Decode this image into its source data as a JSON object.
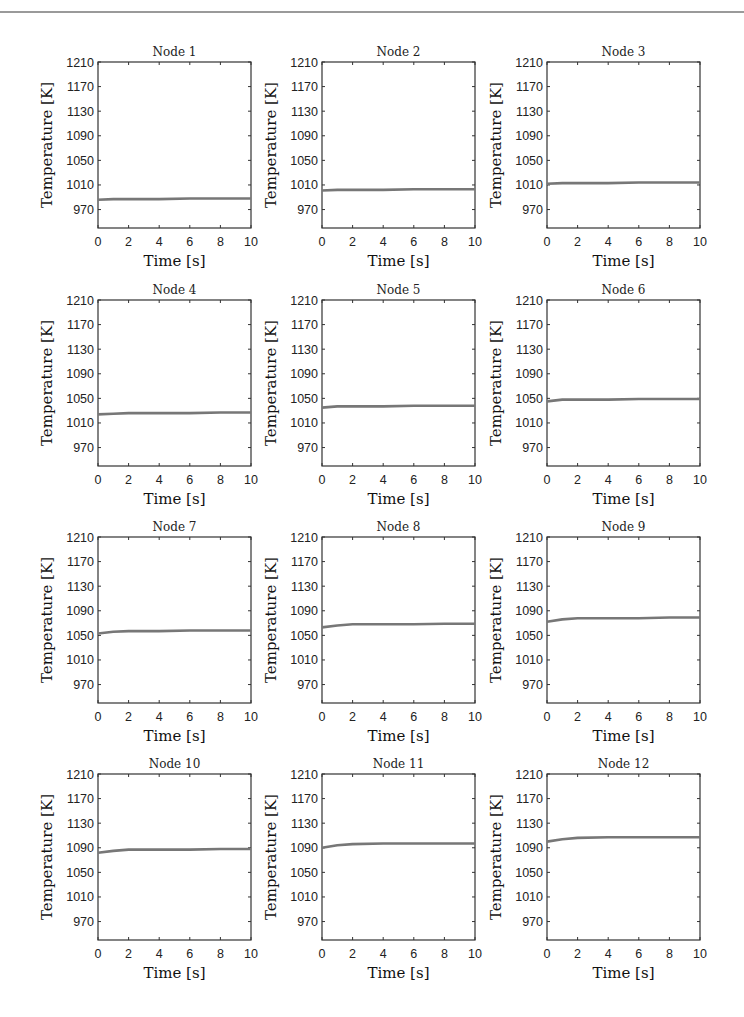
{
  "figure": {
    "layout": {
      "rows": 4,
      "cols": 3
    },
    "line_color": "#777777",
    "axis_color": "#333333"
  },
  "chart_data": [
    {
      "type": "line",
      "title": "Node 1",
      "xlabel": "Time [s]",
      "ylabel": "Temperature [K]",
      "xlim": [
        0,
        10
      ],
      "ylim": [
        940,
        1210
      ],
      "xticks": [
        0,
        2,
        4,
        6,
        8,
        10
      ],
      "yticks": [
        970,
        1010,
        1050,
        1090,
        1130,
        1170,
        1210
      ],
      "grid": false,
      "series": [
        {
          "name": "Node 1",
          "x": [
            0,
            1,
            2,
            4,
            6,
            8,
            10
          ],
          "y": [
            986,
            987,
            987,
            987,
            988,
            988,
            988
          ]
        }
      ]
    },
    {
      "type": "line",
      "title": "Node 2",
      "xlabel": "Time [s]",
      "ylabel": "Temperature [K]",
      "xlim": [
        0,
        10
      ],
      "ylim": [
        940,
        1210
      ],
      "xticks": [
        0,
        2,
        4,
        6,
        8,
        10
      ],
      "yticks": [
        970,
        1010,
        1050,
        1090,
        1130,
        1170,
        1210
      ],
      "grid": false,
      "series": [
        {
          "name": "Node 2",
          "x": [
            0,
            1,
            2,
            4,
            6,
            8,
            10
          ],
          "y": [
            1001,
            1002,
            1002,
            1002,
            1003,
            1003,
            1003
          ]
        }
      ]
    },
    {
      "type": "line",
      "title": "Node 3",
      "xlabel": "Time [s]",
      "ylabel": "Temperature [K]",
      "xlim": [
        0,
        10
      ],
      "ylim": [
        940,
        1210
      ],
      "xticks": [
        0,
        2,
        4,
        6,
        8,
        10
      ],
      "yticks": [
        970,
        1010,
        1050,
        1090,
        1130,
        1170,
        1210
      ],
      "grid": false,
      "series": [
        {
          "name": "Node 3",
          "x": [
            0,
            1,
            2,
            4,
            6,
            8,
            10
          ],
          "y": [
            1012,
            1013,
            1013,
            1013,
            1014,
            1014,
            1014
          ]
        }
      ]
    },
    {
      "type": "line",
      "title": "Node 4",
      "xlabel": "Time [s]",
      "ylabel": "Temperature [K]",
      "xlim": [
        0,
        10
      ],
      "ylim": [
        940,
        1210
      ],
      "xticks": [
        0,
        2,
        4,
        6,
        8,
        10
      ],
      "yticks": [
        970,
        1010,
        1050,
        1090,
        1130,
        1170,
        1210
      ],
      "grid": false,
      "series": [
        {
          "name": "Node 4",
          "x": [
            0,
            1,
            2,
            4,
            6,
            8,
            10
          ],
          "y": [
            1024,
            1025,
            1026,
            1026,
            1026,
            1027,
            1027
          ]
        }
      ]
    },
    {
      "type": "line",
      "title": "Node 5",
      "xlabel": "Time [s]",
      "ylabel": "Temperature [K]",
      "xlim": [
        0,
        10
      ],
      "ylim": [
        940,
        1210
      ],
      "xticks": [
        0,
        2,
        4,
        6,
        8,
        10
      ],
      "yticks": [
        970,
        1010,
        1050,
        1090,
        1130,
        1170,
        1210
      ],
      "grid": false,
      "series": [
        {
          "name": "Node 5",
          "x": [
            0,
            1,
            2,
            4,
            6,
            8,
            10
          ],
          "y": [
            1035,
            1037,
            1037,
            1037,
            1038,
            1038,
            1038
          ]
        }
      ]
    },
    {
      "type": "line",
      "title": "Node 6",
      "xlabel": "Time [s]",
      "ylabel": "Temperature [K]",
      "xlim": [
        0,
        10
      ],
      "ylim": [
        940,
        1210
      ],
      "xticks": [
        0,
        2,
        4,
        6,
        8,
        10
      ],
      "yticks": [
        970,
        1010,
        1050,
        1090,
        1130,
        1170,
        1210
      ],
      "grid": false,
      "series": [
        {
          "name": "Node 6",
          "x": [
            0,
            1,
            2,
            4,
            6,
            8,
            10
          ],
          "y": [
            1045,
            1048,
            1048,
            1048,
            1049,
            1049,
            1049
          ]
        }
      ]
    },
    {
      "type": "line",
      "title": "Node 7",
      "xlabel": "Time [s]",
      "ylabel": "Temperature [K]",
      "xlim": [
        0,
        10
      ],
      "ylim": [
        940,
        1210
      ],
      "xticks": [
        0,
        2,
        4,
        6,
        8,
        10
      ],
      "yticks": [
        970,
        1010,
        1050,
        1090,
        1130,
        1170,
        1210
      ],
      "grid": false,
      "series": [
        {
          "name": "Node 7",
          "x": [
            0,
            1,
            2,
            4,
            6,
            8,
            10
          ],
          "y": [
            1053,
            1056,
            1057,
            1057,
            1058,
            1058,
            1058
          ]
        }
      ]
    },
    {
      "type": "line",
      "title": "Node 8",
      "xlabel": "Time [s]",
      "ylabel": "Temperature [K]",
      "xlim": [
        0,
        10
      ],
      "ylim": [
        940,
        1210
      ],
      "xticks": [
        0,
        2,
        4,
        6,
        8,
        10
      ],
      "yticks": [
        970,
        1010,
        1050,
        1090,
        1130,
        1170,
        1210
      ],
      "grid": false,
      "series": [
        {
          "name": "Node 8",
          "x": [
            0,
            1,
            2,
            4,
            6,
            8,
            10
          ],
          "y": [
            1063,
            1066,
            1068,
            1068,
            1068,
            1069,
            1069
          ]
        }
      ]
    },
    {
      "type": "line",
      "title": "Node 9",
      "xlabel": "Time [s]",
      "ylabel": "Temperature [K]",
      "xlim": [
        0,
        10
      ],
      "ylim": [
        940,
        1210
      ],
      "xticks": [
        0,
        2,
        4,
        6,
        8,
        10
      ],
      "yticks": [
        970,
        1010,
        1050,
        1090,
        1130,
        1170,
        1210
      ],
      "grid": false,
      "series": [
        {
          "name": "Node 9",
          "x": [
            0,
            1,
            2,
            4,
            6,
            8,
            10
          ],
          "y": [
            1072,
            1076,
            1078,
            1078,
            1078,
            1079,
            1079
          ]
        }
      ]
    },
    {
      "type": "line",
      "title": "Node 10",
      "xlabel": "Time [s]",
      "ylabel": "Temperature [K]",
      "xlim": [
        0,
        10
      ],
      "ylim": [
        940,
        1210
      ],
      "xticks": [
        0,
        2,
        4,
        6,
        8,
        10
      ],
      "yticks": [
        970,
        1010,
        1050,
        1090,
        1130,
        1170,
        1210
      ],
      "grid": false,
      "series": [
        {
          "name": "Node 10",
          "x": [
            0,
            1,
            2,
            4,
            6,
            8,
            10
          ],
          "y": [
            1082,
            1085,
            1087,
            1087,
            1087,
            1088,
            1088
          ]
        }
      ]
    },
    {
      "type": "line",
      "title": "Node 11",
      "xlabel": "Time [s]",
      "ylabel": "Temperature [K]",
      "xlim": [
        0,
        10
      ],
      "ylim": [
        940,
        1210
      ],
      "xticks": [
        0,
        2,
        4,
        6,
        8,
        10
      ],
      "yticks": [
        970,
        1010,
        1050,
        1090,
        1130,
        1170,
        1210
      ],
      "grid": false,
      "series": [
        {
          "name": "Node 11",
          "x": [
            0,
            1,
            2,
            4,
            6,
            8,
            10
          ],
          "y": [
            1090,
            1094,
            1096,
            1097,
            1097,
            1097,
            1097
          ]
        }
      ]
    },
    {
      "type": "line",
      "title": "Node 12",
      "xlabel": "Time [s]",
      "ylabel": "Temperature [K]",
      "xlim": [
        0,
        10
      ],
      "ylim": [
        940,
        1210
      ],
      "xticks": [
        0,
        2,
        4,
        6,
        8,
        10
      ],
      "yticks": [
        970,
        1010,
        1050,
        1090,
        1130,
        1170,
        1210
      ],
      "grid": false,
      "series": [
        {
          "name": "Node 12",
          "x": [
            0,
            1,
            2,
            4,
            6,
            8,
            10
          ],
          "y": [
            1100,
            1104,
            1106,
            1107,
            1107,
            1107,
            1107
          ]
        }
      ]
    }
  ]
}
